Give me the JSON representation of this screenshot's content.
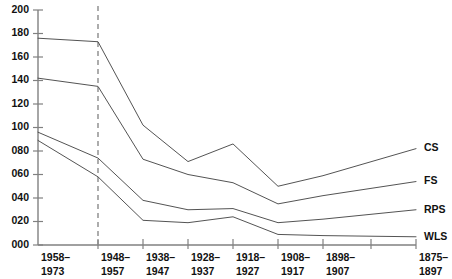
{
  "chart_data": {
    "type": "line",
    "title": "",
    "subtitle": "",
    "xlabel": "",
    "ylabel": "",
    "ylim": [
      0,
      200
    ],
    "ytick_labels": [
      "000",
      "020",
      "040",
      "060",
      "080",
      "100",
      "120",
      "140",
      "160",
      "180",
      "200"
    ],
    "ytick_values": [
      0,
      20,
      40,
      60,
      80,
      100,
      120,
      140,
      160,
      180,
      200
    ],
    "grid": false,
    "legend_position": "right-of-line-ends",
    "categories": [
      "1958–\n1973",
      "1948–\n1957",
      "1938–\n1947",
      "1928–\n1937",
      "1918–\n1927",
      "1908–\n1917",
      "1898–\n1907",
      "1875–\n1897"
    ],
    "category_lines": [
      [
        "1958–",
        "1973"
      ],
      [
        "1948–",
        "1957"
      ],
      [
        "1938–",
        "1947"
      ],
      [
        "1928–",
        "1937"
      ],
      [
        "1918–",
        "1927"
      ],
      [
        "1908–",
        "1917"
      ],
      [
        "1898–",
        "1907"
      ],
      [
        "1875–",
        "1897"
      ]
    ],
    "annotations": [
      {
        "name": "reference-line",
        "type": "vertical-dashed-line",
        "at_category": "1948–1957"
      }
    ],
    "series": [
      {
        "name": "CS",
        "values": [
          176,
          173,
          102,
          71,
          86,
          50,
          59,
          82
        ]
      },
      {
        "name": "FS",
        "values": [
          142,
          135,
          73,
          60,
          53,
          35,
          42,
          54
        ]
      },
      {
        "name": "RPS",
        "values": [
          96,
          74,
          38,
          30,
          31,
          19,
          22,
          30
        ]
      },
      {
        "name": "WLS",
        "values": [
          89,
          58,
          21,
          19,
          24,
          9,
          8,
          7
        ]
      }
    ],
    "colors": {
      "line": "#4a4a4a",
      "axis": "#808080",
      "text": "#111111",
      "reference": "#8a8a8a",
      "background": "#ffffff"
    }
  }
}
